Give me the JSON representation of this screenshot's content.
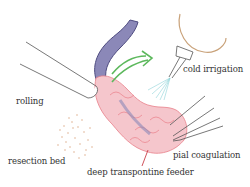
{
  "figure": {
    "type": "surgical-illustration",
    "labels": {
      "cold_irrigation": "cold irrigation",
      "rolling": "rolling",
      "resection_bed": "resection bed",
      "pial_coagulation": "pial coagulation",
      "deep_transpontine_feeder": "deep transpontine feeder"
    },
    "colors": {
      "vessel": "#6b6a9e",
      "lesion": "#e9808a",
      "lesion_fill": "#f5c6cc",
      "arrow": "#5cb85c",
      "syringe": "#c9a27a",
      "spray": "#8fd3d8",
      "dots": "#d9a07a",
      "instrument": "#555555"
    }
  }
}
